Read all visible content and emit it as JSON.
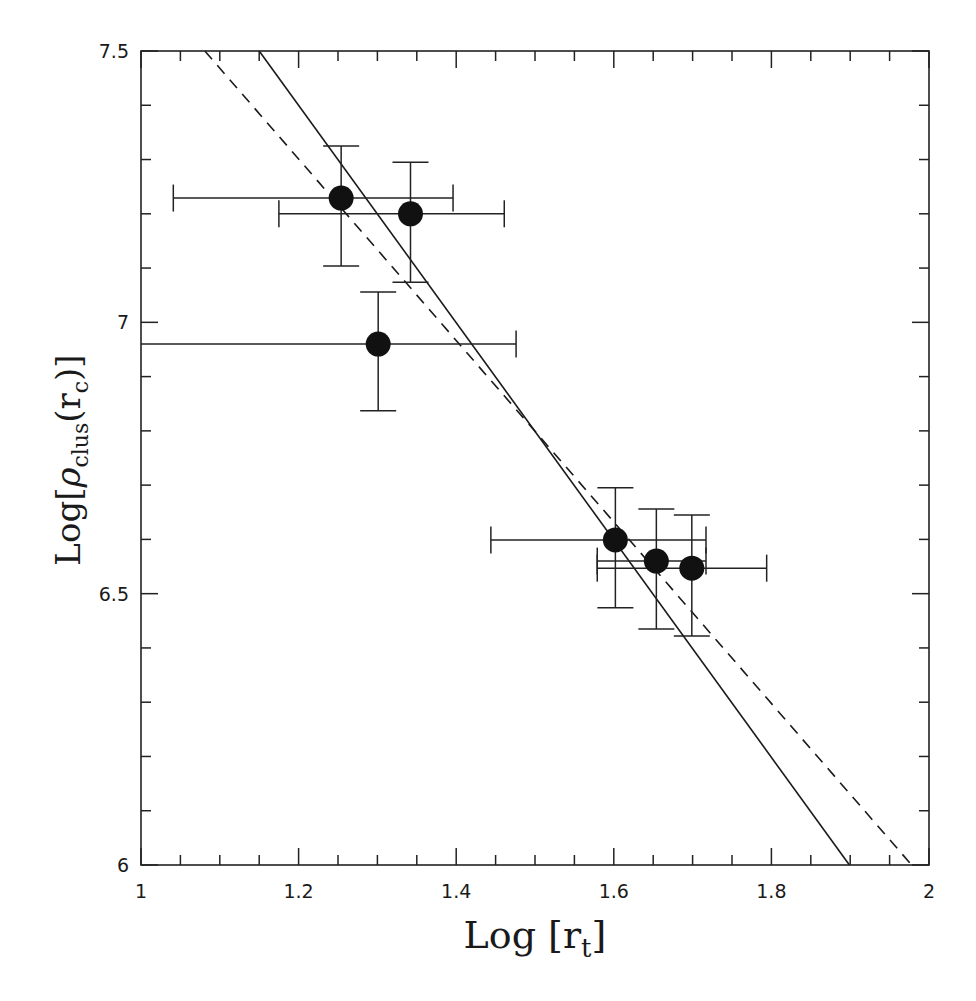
{
  "chart_data": {
    "type": "scatter",
    "title": "",
    "xlabel": "Log [r_t]",
    "ylabel": "Log[ρ_clus(r_c)]",
    "xlabel_parts": {
      "main": "Log [r",
      "sub": "t",
      "close": "]"
    },
    "ylabel_parts": {
      "prefix": "Log[",
      "rho": "ρ",
      "sub": "clus",
      "mid": "(r",
      "sub2": "c",
      "suffix": ")]"
    },
    "xlim": [
      1,
      2
    ],
    "ylim": [
      6,
      7.5
    ],
    "xticks_major": [
      1,
      1.2,
      1.4,
      1.6,
      1.8,
      2
    ],
    "xtick_labels": [
      "1",
      "1.2",
      "1.4",
      "1.6",
      "1.8",
      "2"
    ],
    "xticks_minor_step": 0.05,
    "yticks_major": [
      6,
      6.5,
      7,
      7.5
    ],
    "ytick_labels": [
      "6",
      "6.5",
      "7",
      "7.5"
    ],
    "yticks_minor_step": 0.1,
    "grid": false,
    "legend": null,
    "series": [
      {
        "name": "clusters",
        "marker": "filled-circle",
        "color": "#111111",
        "points": [
          {
            "x": 1.254,
            "y": 7.229,
            "xlo": 1.041,
            "xhi": 1.396,
            "ylo": 7.104,
            "yhi": 7.325
          },
          {
            "x": 1.342,
            "y": 7.2,
            "xlo": 1.175,
            "xhi": 1.461,
            "ylo": 7.074,
            "yhi": 7.295
          },
          {
            "x": 1.301,
            "y": 6.96,
            "xlo": 1.0,
            "xhi": 1.476,
            "ylo": 6.837,
            "yhi": 7.056
          },
          {
            "x": 1.602,
            "y": 6.599,
            "xlo": 1.444,
            "xhi": 1.717,
            "ylo": 6.474,
            "yhi": 6.695
          },
          {
            "x": 1.654,
            "y": 6.56,
            "xlo": 1.579,
            "xhi": 1.717,
            "ylo": 6.435,
            "yhi": 6.656
          },
          {
            "x": 1.699,
            "y": 6.547,
            "xlo": 1.579,
            "xhi": 1.794,
            "ylo": 6.422,
            "yhi": 6.645
          }
        ]
      }
    ],
    "lines": [
      {
        "name": "fit-solid",
        "style": "solid",
        "x": [
          1.15,
          1.899
        ],
        "y": [
          7.5,
          6.0
        ]
      },
      {
        "name": "fit-dashed",
        "style": "dashed",
        "x": [
          1.081,
          1.978
        ],
        "y": [
          7.5,
          6.0
        ]
      }
    ]
  }
}
